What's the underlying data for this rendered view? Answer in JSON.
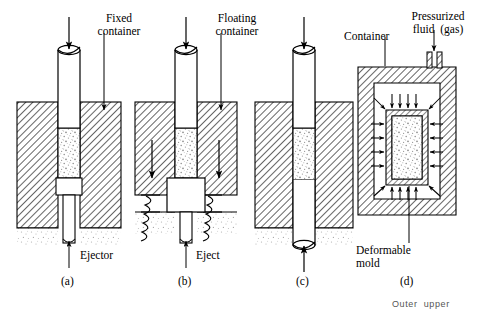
{
  "figure": {
    "title_caption": "",
    "background_color": "#ffffff",
    "ink_color": "#000000",
    "hatch_color": "#555555",
    "powder_color": "#999999"
  },
  "labels": {
    "fixed_container": "Fixed\ncontainer",
    "floating_container": "Floating\ncontainer",
    "ejector": "Ejector",
    "eject": "Eject",
    "container": "Container",
    "pressurized_fluid": "Pressurized\nfluid  (gas)",
    "deformable_mold": "Deformable\nmold",
    "outer_upper": "Outer  upper"
  },
  "panels": [
    {
      "id": "a",
      "caption": "(a)",
      "name": "single-action-fixed-container"
    },
    {
      "id": "b",
      "caption": "(b)",
      "name": "double-action-floating-container"
    },
    {
      "id": "c",
      "caption": "(c)",
      "name": "double-action-opposed-punches"
    },
    {
      "id": "d",
      "caption": "(d)",
      "name": "isostatic-pressing"
    }
  ]
}
